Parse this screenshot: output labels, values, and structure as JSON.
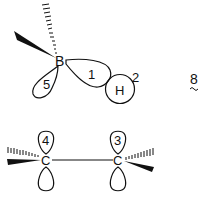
{
  "diagram": {
    "type": "orbital-interaction",
    "compound_number": "8",
    "atoms": {
      "boron": "B",
      "hydrogen": "H",
      "carbon_left": "C",
      "carbon_right": "C"
    },
    "orbital_labels": {
      "b_h_bond_orbital": "1",
      "hydrogen_orbital": "2",
      "carbon_right_p_orbital": "3",
      "carbon_left_p_orbital": "4",
      "boron_empty_orbital": "5"
    },
    "colors": {
      "line": "#111111",
      "background": "#ffffff"
    }
  }
}
